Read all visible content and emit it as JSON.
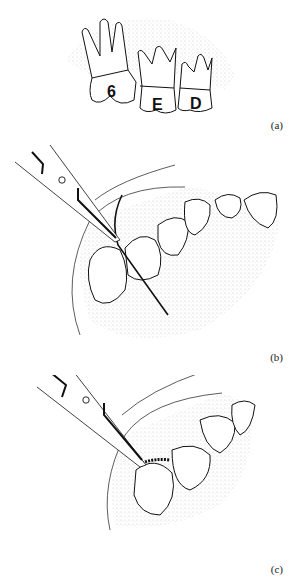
{
  "figure": {
    "panels": [
      {
        "id": "a",
        "caption": "(a)",
        "description": "Three extracted teeth side by side with roots upward",
        "teeth_labels": [
          "6",
          "E",
          "D"
        ]
      },
      {
        "id": "b",
        "caption": "(b)",
        "description": "Scissors/holder passing a wire ligature between teeth of the arch"
      },
      {
        "id": "c",
        "caption": "(c)",
        "description": "Scissors at twisted wire ligature around molar"
      }
    ]
  }
}
